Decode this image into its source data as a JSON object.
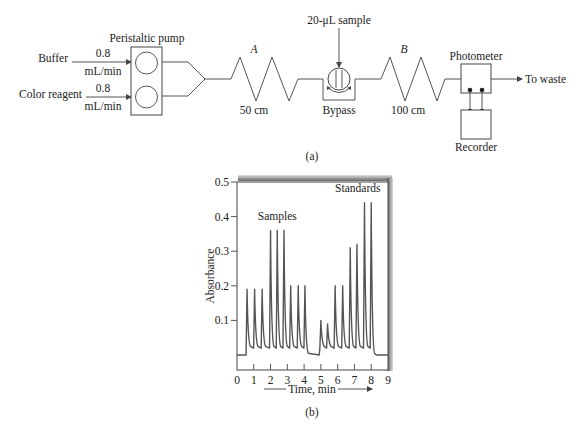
{
  "diagram": {
    "caption": "(a)",
    "inputs": [
      {
        "name": "Buffer",
        "flow_value": "0.8",
        "flow_unit": "mL/min"
      },
      {
        "name": "Color reagent",
        "flow_value": "0.8",
        "flow_unit": "mL/min"
      }
    ],
    "pump_label": "Peristaltic pump",
    "coil_a": {
      "name": "A",
      "length": "50 cm"
    },
    "sample_label": "20-μL sample",
    "valve_label": "Bypass",
    "coil_b": {
      "name": "B",
      "length": "100 cm"
    },
    "photometer_label": "Photometer",
    "recorder_label": "Recorder",
    "output_label": "To waste"
  },
  "chart_data": {
    "type": "line",
    "caption": "(b)",
    "title": "",
    "xlabel": "Time, min",
    "ylabel": "Absorbance",
    "xlim": [
      0,
      9
    ],
    "ylim": [
      0,
      0.5
    ],
    "x_ticks": [
      "0",
      "1",
      "2",
      "3",
      "4",
      "5",
      "6",
      "7",
      "8",
      "9"
    ],
    "y_ticks": [
      "0.1",
      "0.2",
      "0.3",
      "0.4",
      "0.5"
    ],
    "grid": false,
    "annotations": [
      {
        "text": "Samples",
        "x": 2.4,
        "y": 0.39
      },
      {
        "text": "Standards",
        "x": 7.2,
        "y": 0.47
      }
    ],
    "baseline": 0.0,
    "start_time": 0.55,
    "series": [
      {
        "name": "Samples",
        "peaks": [
          {
            "t": 0.6,
            "a": 0.19
          },
          {
            "t": 1.05,
            "a": 0.19
          },
          {
            "t": 1.5,
            "a": 0.19
          },
          {
            "t": 2.0,
            "a": 0.36
          },
          {
            "t": 2.4,
            "a": 0.36
          },
          {
            "t": 2.8,
            "a": 0.36
          },
          {
            "t": 3.2,
            "a": 0.2
          },
          {
            "t": 3.65,
            "a": 0.2
          },
          {
            "t": 4.05,
            "a": 0.2
          }
        ]
      },
      {
        "name": "Standards",
        "peaks": [
          {
            "t": 5.0,
            "a": 0.1
          },
          {
            "t": 5.4,
            "a": 0.09
          },
          {
            "t": 5.85,
            "a": 0.2
          },
          {
            "t": 6.3,
            "a": 0.2
          },
          {
            "t": 6.75,
            "a": 0.31
          },
          {
            "t": 7.15,
            "a": 0.32
          },
          {
            "t": 7.6,
            "a": 0.44
          },
          {
            "t": 8.0,
            "a": 0.44
          }
        ]
      }
    ]
  }
}
